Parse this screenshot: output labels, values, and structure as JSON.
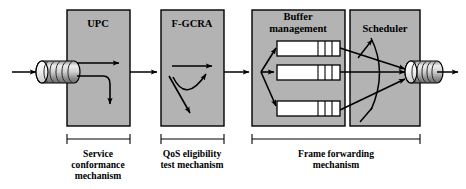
{
  "diagram": {
    "background_color": "#ffffff",
    "block_fill": "#b3b3b3",
    "block_stroke": "#000000",
    "line_color": "#000000",
    "blocks": [
      {
        "id": "upc",
        "label": "UPC",
        "x": 67,
        "y": 10,
        "width": 63,
        "height": 116,
        "label_x": 98,
        "label_y": 24
      },
      {
        "id": "fgcra",
        "label": "F-GCRA",
        "x": 161,
        "y": 10,
        "width": 63,
        "height": 116,
        "label_x": 192,
        "label_y": 24
      },
      {
        "id": "buffer-management",
        "label_line1": "Buffer",
        "label_line2": "management",
        "x": 252,
        "y": 10,
        "width": 93,
        "height": 116,
        "label_x": 298,
        "label_y": 20
      },
      {
        "id": "scheduler",
        "label": "Scheduler",
        "x": 350,
        "y": 10,
        "width": 70,
        "height": 116,
        "label_x": 385,
        "label_y": 28
      }
    ],
    "brackets": [
      {
        "id": "service-conformance",
        "x1": 67,
        "x2": 130,
        "y": 139,
        "label_line1": "Service",
        "label_line2": "conformance",
        "label_line3": "mechanism",
        "label_x": 98,
        "label_y": 154
      },
      {
        "id": "qos-eligibility",
        "x1": 161,
        "x2": 224,
        "y": 139,
        "label_line1": "QoS eligibility",
        "label_line2": "test mechanism",
        "label_line3": "",
        "label_x": 192,
        "label_y": 154
      },
      {
        "id": "frame-forwarding",
        "x1": 252,
        "x2": 420,
        "y": 139,
        "label_line1": "Frame forwarding",
        "label_line2": "mechanism",
        "label_line3": "",
        "label_x": 336,
        "label_y": 154
      }
    ],
    "cylinders": [
      {
        "id": "input-cylinder",
        "cx": 55,
        "cy": 72,
        "length": 36,
        "ry": 11,
        "rings": 6
      },
      {
        "id": "output-cylinder",
        "cx": 424,
        "cy": 72,
        "length": 36,
        "ry": 11,
        "rings": 6
      }
    ],
    "queues": [
      {
        "id": "queue-1",
        "x": 277,
        "y": 41,
        "width": 63,
        "height": 15
      },
      {
        "id": "queue-2",
        "x": 277,
        "y": 65,
        "width": 63,
        "height": 15
      },
      {
        "id": "queue-3",
        "x": 277,
        "y": 101,
        "width": 63,
        "height": 15
      }
    ],
    "flow_arrows": [
      {
        "id": "ingress-arrow",
        "label": "incoming frame stream"
      },
      {
        "id": "upc-pass-arrow",
        "label": "conforming"
      },
      {
        "id": "upc-discard-arrow",
        "label": "non-conforming discard"
      },
      {
        "id": "upc-to-fgcra-arrow",
        "label": "link"
      },
      {
        "id": "fgcra-pass-arrow",
        "label": "eligible"
      },
      {
        "id": "fgcra-tag-arrow",
        "label": "tagged"
      },
      {
        "id": "fgcra-to-buffer-arrow",
        "label": "link"
      },
      {
        "id": "buffer-fanout-arrow-1",
        "label": "enqueue high"
      },
      {
        "id": "buffer-fanout-arrow-2",
        "label": "enqueue mid"
      },
      {
        "id": "buffer-fanout-arrow-3",
        "label": "enqueue low"
      },
      {
        "id": "scheduler-in-arrow-1",
        "label": "dequeue high"
      },
      {
        "id": "scheduler-in-arrow-2",
        "label": "dequeue mid"
      },
      {
        "id": "scheduler-in-arrow-3",
        "label": "dequeue low"
      },
      {
        "id": "egress-arrow",
        "label": "outgoing frame stream"
      }
    ]
  }
}
